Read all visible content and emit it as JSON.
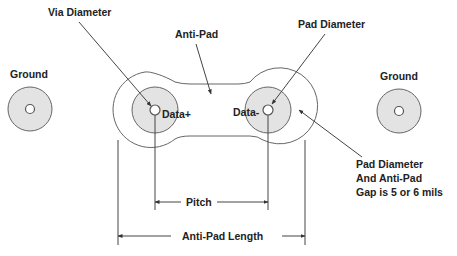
{
  "diagram": {
    "labels": {
      "via_diameter": "Via Diameter",
      "anti_pad": "Anti-Pad",
      "pad_diameter": "Pad Diameter",
      "ground_left": "Ground",
      "ground_right": "Ground",
      "data_plus": "Data+",
      "data_minus": "Data-",
      "gap_note_line1": "Pad Diameter",
      "gap_note_line2": "And Anti-Pad",
      "gap_note_line3": "Gap is 5 or 6 mils",
      "pitch": "Pitch",
      "anti_pad_length": "Anti-Pad Length"
    },
    "colors": {
      "pad_fill": "#e3e3e3",
      "outline": "#666666",
      "text": "#222222",
      "background": "#ffffff"
    }
  }
}
